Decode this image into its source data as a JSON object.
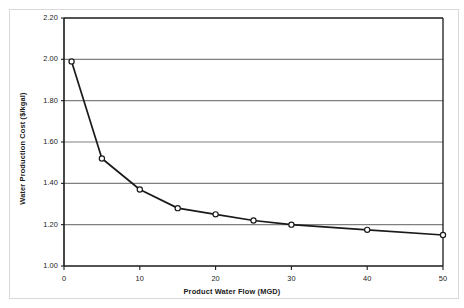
{
  "chart_data": {
    "type": "line",
    "title": "",
    "xlabel": "Product Water Flow (MGD)",
    "ylabel": "Water Production Cost ($/kgal)",
    "xlim": [
      0,
      50
    ],
    "ylim": [
      1.0,
      2.2
    ],
    "xticks": [
      0,
      10,
      20,
      30,
      40,
      50
    ],
    "xtick_labels": [
      "0",
      "10",
      "20",
      "30",
      "40",
      "50"
    ],
    "yticks": [
      1.0,
      1.2,
      1.4,
      1.6,
      1.8,
      2.0,
      2.2
    ],
    "ytick_labels": [
      "1.00",
      "1.20",
      "1.40",
      "1.60",
      "1.80",
      "2.00",
      "2.20"
    ],
    "grid": "horizontal",
    "legend": "none",
    "marker": "open-circle",
    "line_color": "#1a1a1a",
    "grid_color": "#808080",
    "axis_color": "#1a1a1a",
    "marker_fill": "#ffffff",
    "x": [
      1,
      5,
      10,
      15,
      20,
      25,
      30,
      40,
      50
    ],
    "values": [
      1.99,
      1.52,
      1.37,
      1.28,
      1.25,
      1.22,
      1.2,
      1.175,
      1.15
    ],
    "series": [
      {
        "name": "Water Production Cost",
        "points": [
          {
            "x": 1,
            "y": 1.99
          },
          {
            "x": 5,
            "y": 1.52
          },
          {
            "x": 10,
            "y": 1.37
          },
          {
            "x": 15,
            "y": 1.28
          },
          {
            "x": 20,
            "y": 1.25
          },
          {
            "x": 25,
            "y": 1.22
          },
          {
            "x": 30,
            "y": 1.2
          },
          {
            "x": 40,
            "y": 1.175
          },
          {
            "x": 50,
            "y": 1.15
          }
        ]
      }
    ]
  }
}
